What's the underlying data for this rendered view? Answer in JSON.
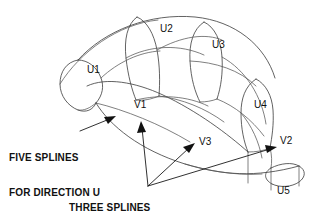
{
  "diagram": {
    "background_color": "#ffffff",
    "line_color": "#3a3a3a",
    "text_color": "#111111",
    "u_spline_count": 5,
    "v_spline_count": 3
  },
  "labels": {
    "u1": "U1",
    "u2": "U2",
    "u3": "U3",
    "u4": "U4",
    "u5": "U5",
    "v1": "V1",
    "v2": "V2",
    "v3": "V3"
  },
  "annotations": {
    "u_note_line1": "FIVE SPLINES",
    "u_note_line2": "FOR DIRECTION U",
    "v_note_line1": "THREE SPLINES",
    "v_note_line2": "FOR DIRECTION V"
  }
}
